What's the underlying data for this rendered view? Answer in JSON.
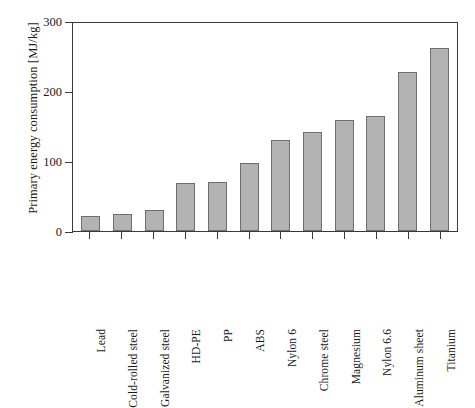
{
  "chart_data": {
    "type": "bar",
    "title": "",
    "xlabel": "",
    "ylabel": "Primary energy consumption [MJ/kg]",
    "ylim": [
      0,
      300
    ],
    "yticks": [
      0,
      100,
      200,
      300
    ],
    "ytick_labels": [
      "0",
      "100",
      "200",
      "300"
    ],
    "grid": false,
    "legend": "none",
    "bar_color": "#b3b3b3",
    "bar_edge_color": "#6e6e6e",
    "axis_color": "#3a3a3a",
    "categories": [
      "Lead",
      "Cold-rolled steel",
      "Galvanized steel",
      "HD-PE",
      "PP",
      "ABS",
      "Nylon 6",
      "Chrome steel",
      "Magnesium",
      "Nylon 6.6",
      "Aluminum sheet",
      "Titanium"
    ],
    "values": [
      21,
      24,
      30,
      68,
      70,
      97,
      130,
      142,
      159,
      164,
      227,
      261
    ]
  }
}
